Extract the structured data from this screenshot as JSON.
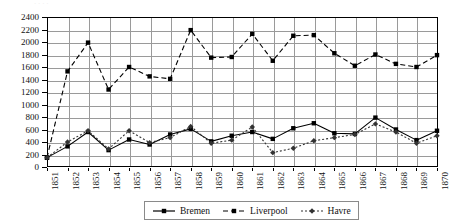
{
  "figure": {
    "top_ghost_text": "·  ·      ·        ·"
  },
  "legend": {
    "position": "bottom-center",
    "entries": [
      {
        "label": "Bremen",
        "marker": "square",
        "line": "solid",
        "color": "#000000"
      },
      {
        "label": "Liverpool",
        "marker": "square",
        "line": "dashed",
        "color": "#000000"
      },
      {
        "label": "Havre",
        "marker": "diamond",
        "line": "dotted",
        "color": "#333333"
      }
    ]
  },
  "axes": {
    "y_ticks": [
      0,
      200,
      400,
      600,
      800,
      1000,
      1200,
      1400,
      1600,
      1800,
      2000,
      2200,
      2400
    ],
    "x_ticks": [
      "1851",
      "1852",
      "1853",
      "1854",
      "1855",
      "1856",
      "1857",
      "1858",
      "1859",
      "1860",
      "1861",
      "1862",
      "1863",
      "1864",
      "1865",
      "1866",
      "1867",
      "1868",
      "1869",
      "1870"
    ]
  },
  "chart_data": {
    "type": "line",
    "title": "",
    "subtitle": "",
    "xlabel": "",
    "ylabel": "",
    "xlim": [
      "1851",
      "1870"
    ],
    "ylim": [
      0,
      2400
    ],
    "ytick_step": 200,
    "grid": true,
    "legend_position": "bottom-center",
    "x": [
      "1851",
      "1852",
      "1853",
      "1854",
      "1855",
      "1856",
      "1857",
      "1858",
      "1859",
      "1860",
      "1861",
      "1862",
      "1863",
      "1864",
      "1865",
      "1866",
      "1867",
      "1868",
      "1869",
      "1870"
    ],
    "series": [
      {
        "name": "Bremen",
        "marker": "square",
        "line_style": "solid",
        "color": "#000000",
        "values": [
          150,
          330,
          560,
          270,
          440,
          360,
          520,
          610,
          410,
          500,
          560,
          450,
          620,
          700,
          540,
          530,
          790,
          600,
          430,
          580
        ]
      },
      {
        "name": "Liverpool",
        "marker": "square",
        "line_style": "dashed",
        "color": "#000000",
        "values": [
          150,
          1530,
          1990,
          1240,
          1600,
          1450,
          1410,
          2190,
          1750,
          1760,
          2130,
          1700,
          2100,
          2110,
          1820,
          1620,
          1800,
          1650,
          1600,
          1790
        ]
      },
      {
        "name": "Havre",
        "marker": "diamond",
        "line_style": "dotted",
        "color": "#333333",
        "values": [
          150,
          400,
          580,
          290,
          580,
          390,
          470,
          650,
          380,
          430,
          640,
          230,
          300,
          420,
          470,
          520,
          690,
          560,
          380,
          500
        ]
      }
    ]
  }
}
